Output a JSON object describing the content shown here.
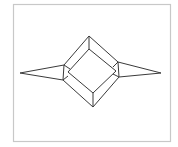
{
  "figure": {
    "colors": {
      "background": "#ffffff",
      "frame": "#c8c8c8",
      "stroke": "#3a3a3a"
    },
    "frame_rect": {
      "x": 13,
      "y": 4,
      "width": 157,
      "height": 137
    },
    "outer_diamond": [
      [
        89,
        36
      ],
      [
        118,
        62
      ],
      [
        119,
        77
      ],
      [
        93,
        107
      ],
      [
        63,
        80
      ],
      [
        64,
        65
      ]
    ],
    "inner_diamond": [
      [
        89,
        49
      ],
      [
        116,
        71
      ],
      [
        93,
        93
      ],
      [
        68,
        72
      ]
    ],
    "connectors": [
      [
        [
          89,
          36
        ],
        [
          89,
          49
        ]
      ],
      [
        [
          93,
          107
        ],
        [
          93,
          93
        ]
      ],
      [
        [
          64,
          65
        ],
        [
          70,
          69
        ]
      ],
      [
        [
          63,
          80
        ],
        [
          68,
          76
        ]
      ],
      [
        [
          118,
          62
        ],
        [
          113,
          67
        ]
      ],
      [
        [
          119,
          77
        ],
        [
          113,
          74
        ]
      ]
    ],
    "left_spike": [
      [
        64,
        65
      ],
      [
        20,
        73
      ],
      [
        63,
        80
      ]
    ],
    "right_spike": [
      [
        118,
        62
      ],
      [
        161,
        73
      ],
      [
        119,
        77
      ]
    ]
  }
}
